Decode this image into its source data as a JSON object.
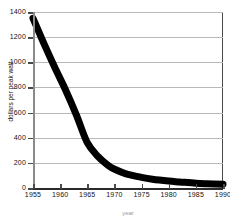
{
  "chart_data": {
    "type": "line",
    "title": "",
    "xlabel": "year",
    "ylabel": "dollars per peak watt",
    "xlim": [
      1955,
      1990
    ],
    "ylim": [
      0,
      1400
    ],
    "grid": true,
    "legend": false,
    "series": [
      {
        "name": "dollars per peak watt",
        "style": "thick-black-band",
        "x": [
          1955,
          1957,
          1959,
          1961,
          1963,
          1965,
          1967,
          1969,
          1970,
          1972,
          1975,
          1977,
          1980,
          1982,
          1985,
          1987,
          1990
        ],
        "values": [
          1350,
          1150,
          960,
          780,
          580,
          360,
          250,
          175,
          150,
          115,
          85,
          70,
          55,
          48,
          38,
          34,
          30
        ]
      }
    ],
    "x_ticks": [
      1955,
      1960,
      1965,
      1970,
      1975,
      1980,
      1985,
      1990
    ],
    "x_tick_labels": [
      "1955",
      "1960",
      "1965",
      "1970",
      "1975",
      "1980",
      "1985",
      "1990"
    ],
    "y_ticks": [
      0,
      200,
      400,
      600,
      800,
      1000,
      1200,
      1400
    ],
    "y_tick_labels": [
      "0",
      "200",
      "400",
      "600",
      "800",
      "1000",
      "1200",
      "1400"
    ],
    "colors": {
      "background": "#ffffff",
      "curve": "#000000",
      "gridline": "#b9b9b9",
      "axis": "#2a2a2a",
      "frame": "#4a4a4a",
      "tick_text": "#111111"
    }
  }
}
